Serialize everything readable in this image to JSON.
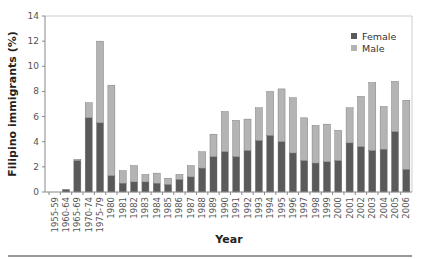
{
  "chart_data": {
    "type": "bar",
    "stacked": true,
    "title": "",
    "xlabel": "Year",
    "ylabel": "Filipino immigrants (%)",
    "ylim": [
      0,
      14
    ],
    "yticks": [
      0,
      2,
      4,
      6,
      8,
      10,
      12,
      14
    ],
    "grid": false,
    "legend_position": "top-right",
    "categories": [
      "1955-59",
      "1960-64",
      "1965-69",
      "1970-74",
      "1975-79",
      "1980",
      "1981",
      "1982",
      "1983",
      "1984",
      "1985",
      "1986",
      "1987",
      "1988",
      "1989",
      "1990",
      "1991",
      "1992",
      "1993",
      "1994",
      "1995",
      "1996",
      "1997",
      "1998",
      "1999",
      "2000",
      "2001",
      "2002",
      "2003",
      "2004",
      "2005",
      "2006"
    ],
    "series": [
      {
        "name": "Female",
        "color": "#5a5a5a",
        "values": [
          0,
          0.2,
          2.5,
          5.9,
          5.5,
          1.3,
          0.7,
          0.8,
          0.8,
          0.7,
          0.6,
          1.0,
          1.2,
          1.9,
          2.8,
          3.2,
          2.8,
          3.3,
          4.1,
          4.5,
          4.0,
          3.1,
          2.5,
          2.3,
          2.4,
          2.5,
          3.9,
          3.6,
          3.3,
          3.4,
          4.8,
          1.8
        ]
      },
      {
        "name": "Male",
        "color": "#b4b4b4",
        "values": [
          0,
          0,
          0.1,
          1.2,
          6.5,
          7.2,
          1.0,
          1.3,
          0.6,
          0.8,
          0.5,
          0.4,
          0.9,
          1.3,
          1.8,
          3.2,
          2.9,
          2.5,
          2.6,
          3.5,
          4.2,
          4.4,
          3.4,
          3.0,
          3.0,
          2.4,
          2.8,
          4.0,
          5.4,
          3.4,
          4.0,
          5.5
        ]
      }
    ]
  },
  "legend": {
    "female_label": "Female",
    "male_label": "Male"
  },
  "axes": {
    "x_title": "Year",
    "y_title": "Filipino immigrants (%)"
  }
}
